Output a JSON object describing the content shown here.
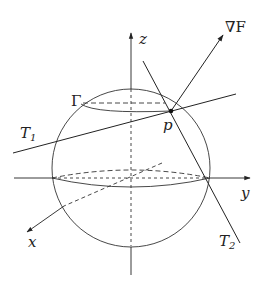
{
  "diagram": {
    "labels": {
      "z_axis": "z",
      "y_axis": "y",
      "x_axis": "x",
      "gradient": "∇F",
      "curve": "Γ",
      "point": "p",
      "tangent1_main": "T",
      "tangent1_sub": "1",
      "tangent2_main": "T",
      "tangent2_sub": "2"
    },
    "colors": {
      "stroke": "#222222",
      "background": "#ffffff"
    }
  }
}
